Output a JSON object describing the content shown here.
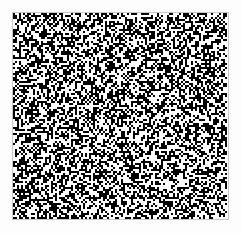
{
  "canvas": {
    "width": 241,
    "height": 233,
    "background_color": "#fdfdfd"
  },
  "pattern": {
    "kind": "2d-barcode-noise-matrix",
    "label": "high-density random dot matrix",
    "x": 13,
    "y": 13,
    "width": 215,
    "height": 206,
    "cell_size": 2,
    "columns": 107,
    "rows": 103,
    "fill_ratio": 0.5,
    "seed": 20250317,
    "foreground_color": "#000000",
    "background_color": "#ffffff",
    "border_color": "#c8c8c8",
    "border_width": 1,
    "has_finder_patterns": false,
    "has_timing_patterns": false,
    "has_alignment_patterns": false
  },
  "quiet_zone": {
    "left": 13,
    "top": 13,
    "right": 13,
    "bottom": 14
  }
}
